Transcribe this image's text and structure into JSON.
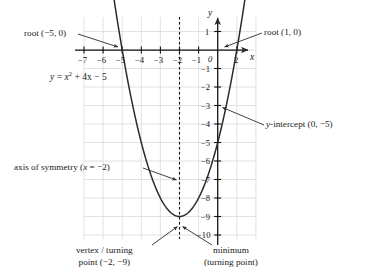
{
  "chart_data": {
    "type": "line",
    "title": "",
    "equation": "y = x² + 4x − 5",
    "equation_parts": {
      "lhs": "y",
      "eq": "=",
      "x": "x",
      "exp": "2",
      "rest": "+ 4x − 5"
    },
    "xlabel": "x",
    "ylabel": "y",
    "xlim": [
      -7.5,
      2.5
    ],
    "ylim": [
      -10.5,
      1.5
    ],
    "x_ticks": [
      -7,
      -6,
      -5,
      -4,
      -3,
      -2,
      -1,
      0,
      1,
      2
    ],
    "x_tick_labels": [
      "−7",
      "−6",
      "−5",
      "−4",
      "−3",
      "−2",
      "−1",
      "0",
      "1",
      "2"
    ],
    "y_ticks": [
      1,
      -1,
      -2,
      -3,
      -4,
      -5,
      -6,
      -7,
      -8,
      -9,
      -10
    ],
    "y_tick_labels": [
      "1",
      "−1",
      "−2",
      "−3",
      "−4",
      "−5",
      "−6",
      "−7",
      "−8",
      "−9",
      "−10"
    ],
    "grid": true,
    "grid_color": "#d9d9e0",
    "curve_color": "#2b2b2b",
    "axis_color": "#111111",
    "points_of_interest": {
      "roots": [
        [
          -5,
          0
        ],
        [
          1,
          0
        ]
      ],
      "vertex": [
        -2,
        -9
      ],
      "y_intercept": [
        0,
        -5
      ],
      "axis_of_symmetry": -2
    },
    "sampled_curve": [
      [
        -7.3,
        19.3
      ],
      [
        -7.0,
        16.0
      ],
      [
        -6.5,
        11.25
      ],
      [
        -6.0,
        7.0
      ],
      [
        -5.5,
        3.25
      ],
      [
        -5.0,
        0.0
      ],
      [
        -4.5,
        -2.75
      ],
      [
        -4.0,
        -5.0
      ],
      [
        -3.5,
        -6.75
      ],
      [
        -3.0,
        -8.0
      ],
      [
        -2.5,
        -8.75
      ],
      [
        -2.0,
        -9.0
      ],
      [
        -1.5,
        -8.75
      ],
      [
        -1.0,
        -8.0
      ],
      [
        -0.5,
        -6.75
      ],
      [
        0.0,
        -5.0
      ],
      [
        0.5,
        -2.75
      ],
      [
        1.0,
        0.0
      ],
      [
        1.3,
        1.89
      ]
    ]
  },
  "annotations": {
    "root_left": {
      "text": "root (−5, 0)",
      "target": [
        -5,
        0
      ]
    },
    "root_right": {
      "text": "root (1, 0)",
      "target": [
        1,
        0
      ]
    },
    "y_intercept": {
      "text": "y-intercept (0, −5)",
      "label_prefix_italic": "y",
      "label_rest": "-intercept (0, −5)",
      "target": [
        0,
        -5
      ]
    },
    "axis_of_symmetry": {
      "text": "axis of symmetry (x = −2)",
      "label_prefix": "axis of symmetry (",
      "label_italic": "x",
      "label_suffix": " = −2)",
      "target": [
        -2,
        -4
      ]
    },
    "vertex": {
      "line1": "vertex / turning",
      "line2": "point (−2, −9)",
      "target": [
        -2,
        -9
      ]
    },
    "minimum": {
      "line1": "minimum",
      "line2": "(turning point)",
      "target": [
        -2,
        -9
      ]
    }
  }
}
